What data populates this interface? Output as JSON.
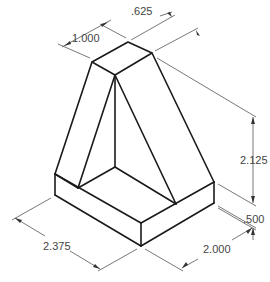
{
  "diagram": {
    "type": "isometric-technical-drawing",
    "colors": {
      "object_lines": "#1a1a1a",
      "dimension_lines": "#555555",
      "text": "#444444",
      "background": "#ffffff"
    },
    "dimensions": {
      "top_width": "1.000",
      "top_depth": ".625",
      "height": "2.125",
      "base_thickness": ".500",
      "base_length": "2.375",
      "base_depth": "2.000"
    }
  }
}
